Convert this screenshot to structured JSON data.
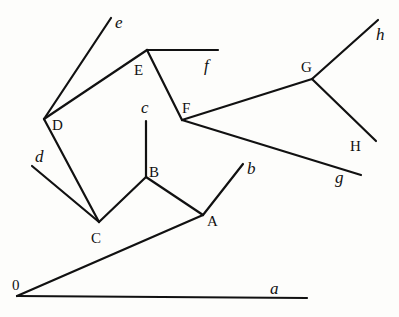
{
  "diagram": {
    "type": "tree",
    "points": {
      "0": [
        17,
        296
      ],
      "a_end": [
        307,
        298
      ],
      "A": [
        203,
        215
      ],
      "b_end": [
        243,
        164
      ],
      "B": [
        146,
        177
      ],
      "c_end": [
        146,
        121
      ],
      "C": [
        99,
        222
      ],
      "d_end": [
        32,
        166
      ],
      "D": [
        44,
        119
      ],
      "e_end": [
        111,
        18
      ],
      "E": [
        147,
        50
      ],
      "f_end": [
        218,
        50
      ],
      "F": [
        182,
        120
      ],
      "G": [
        312,
        79
      ],
      "h_end": [
        378,
        20
      ],
      "H_end": [
        376,
        141
      ],
      "g_end": [
        361,
        175
      ]
    },
    "edges": [
      [
        "0",
        "a_end"
      ],
      [
        "0",
        "A"
      ],
      [
        "A",
        "b_end"
      ],
      [
        "A",
        "B"
      ],
      [
        "B",
        "c_end"
      ],
      [
        "B",
        "C"
      ],
      [
        "C",
        "d_end"
      ],
      [
        "C",
        "D"
      ],
      [
        "D",
        "e_end"
      ],
      [
        "D",
        "E"
      ],
      [
        "E",
        "f_end"
      ],
      [
        "E",
        "F"
      ],
      [
        "F",
        "G"
      ],
      [
        "F",
        "g_end"
      ],
      [
        "G",
        "h_end"
      ],
      [
        "G",
        "H_end"
      ]
    ],
    "node_labels": [
      {
        "id": "label-0",
        "text": "0",
        "x": 12,
        "y": 290
      },
      {
        "id": "label-A",
        "text": "A",
        "x": 207,
        "y": 226
      },
      {
        "id": "label-B",
        "text": "B",
        "x": 149,
        "y": 177
      },
      {
        "id": "label-C",
        "text": "C",
        "x": 91,
        "y": 243
      },
      {
        "id": "label-D",
        "text": "D",
        "x": 52,
        "y": 130
      },
      {
        "id": "label-E",
        "text": "E",
        "x": 134,
        "y": 75
      },
      {
        "id": "label-F",
        "text": "F",
        "x": 182,
        "y": 113
      },
      {
        "id": "label-G",
        "text": "G",
        "x": 301,
        "y": 72
      },
      {
        "id": "label-H",
        "text": "H",
        "x": 350,
        "y": 151
      }
    ],
    "leaf_labels": [
      {
        "id": "label-a",
        "text": "a",
        "x": 270,
        "y": 294
      },
      {
        "id": "label-b",
        "text": "b",
        "x": 247,
        "y": 174
      },
      {
        "id": "label-c",
        "text": "c",
        "x": 141,
        "y": 113
      },
      {
        "id": "label-d",
        "text": "d",
        "x": 35,
        "y": 162
      },
      {
        "id": "label-e",
        "text": "e",
        "x": 115,
        "y": 28
      },
      {
        "id": "label-f",
        "text": "f",
        "x": 204,
        "y": 71
      },
      {
        "id": "label-g",
        "text": "g",
        "x": 335,
        "y": 183
      },
      {
        "id": "label-h",
        "text": "h",
        "x": 376,
        "y": 40
      }
    ]
  }
}
